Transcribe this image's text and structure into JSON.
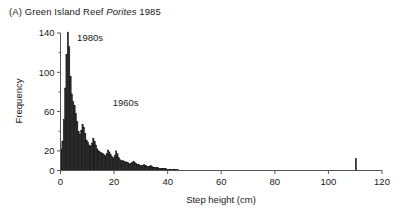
{
  "panel": {
    "label": "(A)",
    "site": "Green Island Reef",
    "taxon": "Porites",
    "year": "1985",
    "full_title": "(A) Green Island Reef Porites 1985"
  },
  "colors": {
    "bar_fill": "#2b2b2b",
    "bar_edge": "#000000",
    "axis": "#555555",
    "text": "#1a1a1a",
    "background": "#ffffff"
  },
  "chart_data": {
    "type": "bar",
    "title": "(A) Green Island Reef Porites 1985",
    "subtitle": "",
    "xlabel": "Step height (cm)",
    "ylabel": "Frequency",
    "xlim": [
      0,
      120
    ],
    "ylim": [
      0,
      140
    ],
    "grid": false,
    "legend": "none",
    "bin_width": 0.5,
    "x_major_ticks": [
      0,
      20,
      40,
      60,
      80,
      100,
      120
    ],
    "x_tick_labels": [
      "0",
      "20",
      "40",
      "60",
      "80",
      "100",
      "120"
    ],
    "y_major_ticks": [
      0,
      20,
      60,
      100,
      140
    ],
    "y_tick_labels": [
      "0",
      "20",
      "60",
      "100",
      "140"
    ],
    "y_minor_ticks": [
      40,
      80,
      120
    ],
    "annotations": [
      {
        "text": "1980s",
        "x": 6.2,
        "y": 132
      },
      {
        "text": "1960s",
        "x": 19.5,
        "y": 66
      }
    ],
    "x": [
      0.25,
      0.75,
      1.25,
      1.75,
      2.25,
      2.75,
      3.25,
      3.75,
      4.25,
      4.75,
      5.25,
      5.75,
      6.25,
      6.75,
      7.25,
      7.75,
      8.25,
      8.75,
      9.25,
      9.75,
      10.25,
      10.75,
      11.25,
      11.75,
      12.25,
      12.75,
      13.25,
      13.75,
      14.25,
      14.75,
      15.25,
      15.75,
      16.25,
      16.75,
      17.25,
      17.75,
      18.25,
      18.75,
      19.25,
      19.75,
      20.25,
      20.75,
      21.25,
      21.75,
      22.25,
      22.75,
      23.25,
      23.75,
      24.25,
      24.75,
      25.25,
      25.75,
      26.25,
      26.75,
      27.25,
      27.75,
      28.25,
      28.75,
      29.25,
      29.75,
      30.25,
      30.75,
      31.25,
      31.75,
      32.25,
      32.75,
      33.25,
      33.75,
      34.25,
      34.75,
      35.25,
      35.75,
      36.25,
      36.75,
      37.25,
      37.75,
      38.25,
      38.75,
      39.25,
      39.75,
      40.25,
      40.75,
      41.25,
      41.75,
      42.25,
      42.75,
      43.25,
      43.75,
      110.25
    ],
    "values": [
      22,
      30,
      52,
      84,
      118,
      141,
      126,
      96,
      78,
      70,
      66,
      58,
      50,
      40,
      37,
      41,
      47,
      44,
      38,
      31,
      29,
      26,
      25,
      28,
      33,
      30,
      26,
      22,
      20,
      19,
      18,
      17,
      16,
      15,
      17,
      21,
      19,
      16,
      14,
      13,
      15,
      20,
      17,
      13,
      11,
      10,
      10,
      9,
      9,
      8,
      8,
      7,
      7,
      8,
      9,
      8,
      7,
      6,
      6,
      5,
      5,
      5,
      6,
      5,
      4,
      4,
      4,
      5,
      4,
      3,
      3,
      3,
      3,
      2,
      2,
      2,
      2,
      2,
      2,
      1,
      1,
      1,
      1,
      1,
      1,
      1,
      1,
      1,
      12
    ]
  }
}
